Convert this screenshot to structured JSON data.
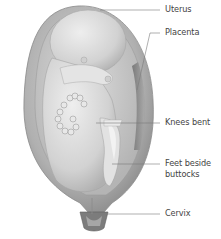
{
  "diagram": {
    "labels": [
      {
        "id": "uterus",
        "text": "Uterus"
      },
      {
        "id": "placenta",
        "text": "Placenta"
      },
      {
        "id": "knees",
        "text": "Knees bent"
      },
      {
        "id": "feet_line1",
        "text": "Feet beside"
      },
      {
        "id": "feet_line2",
        "text": "buttocks"
      },
      {
        "id": "cervix",
        "text": "Cervix"
      }
    ],
    "colors": {
      "uterus_outer": "#9a9a9a",
      "uterus_wall": "#b8b8b8",
      "amniotic": "#cfcfcf",
      "baby": "#dedede",
      "shadow": "#8c8c8c",
      "leader": "#7a7a7a",
      "text": "#444444"
    }
  }
}
